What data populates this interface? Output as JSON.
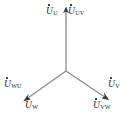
{
  "figure": {
    "type": "phasor-diagram",
    "background_color": "#ffffff",
    "line_color": "#8c8c8c",
    "text_color": "#262626"
  },
  "center": {
    "x": 66,
    "y": 71
  },
  "phasors": [
    {
      "id": "phase-u",
      "direction": "up",
      "angle_deg": 90,
      "tip": {
        "x": 66,
        "y": 8
      },
      "arrowhead": true
    },
    {
      "id": "phase-w",
      "direction": "down-left",
      "angle_deg": 215,
      "tip": {
        "x": 24,
        "y": 100
      },
      "arrowhead": true
    },
    {
      "id": "phase-v",
      "direction": "down-right",
      "angle_deg": 325,
      "tip": {
        "x": 108,
        "y": 99
      },
      "arrowhead": true
    }
  ],
  "labels": {
    "phase_u": {
      "symbol": "U",
      "subscript": "U",
      "dot": true
    },
    "line_uv": {
      "symbol": "U",
      "subscript": "UV",
      "dot": true
    },
    "line_wu": {
      "symbol": "U",
      "subscript": "WU",
      "dot": true
    },
    "phase_w": {
      "symbol": "U",
      "subscript": "W",
      "dot": true
    },
    "phase_v": {
      "symbol": "U",
      "subscript": "V",
      "dot": true
    },
    "line_vw": {
      "symbol": "U",
      "subscript": "VW",
      "dot": true
    }
  }
}
